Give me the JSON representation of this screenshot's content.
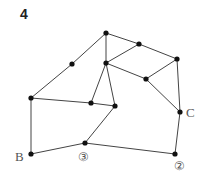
{
  "title": "4",
  "diagram": {
    "type": "graph",
    "nodes": [
      {
        "id": "n1",
        "x": 106,
        "y": 33
      },
      {
        "id": "n2",
        "x": 139,
        "y": 44
      },
      {
        "id": "n3",
        "x": 177,
        "y": 59
      },
      {
        "id": "n4",
        "x": 72,
        "y": 64
      },
      {
        "id": "n5",
        "x": 106,
        "y": 63
      },
      {
        "id": "n6",
        "x": 146,
        "y": 79
      },
      {
        "id": "n7",
        "x": 31,
        "y": 98
      },
      {
        "id": "n8",
        "x": 91,
        "y": 103
      },
      {
        "id": "n9",
        "x": 115,
        "y": 106
      },
      {
        "id": "C",
        "x": 180,
        "y": 112
      },
      {
        "id": "n11",
        "x": 85,
        "y": 143
      },
      {
        "id": "B",
        "x": 31,
        "y": 154
      },
      {
        "id": "n13",
        "x": 175,
        "y": 154
      }
    ],
    "edges": [
      [
        "n1",
        "n2"
      ],
      [
        "n2",
        "n3"
      ],
      [
        "n1",
        "n5"
      ],
      [
        "n1",
        "n4"
      ],
      [
        "n4",
        "n7"
      ],
      [
        "n5",
        "n2"
      ],
      [
        "n5",
        "n6"
      ],
      [
        "n6",
        "n3"
      ],
      [
        "n6",
        "C"
      ],
      [
        "n3",
        "C"
      ],
      [
        "n5",
        "n8"
      ],
      [
        "n5",
        "n9"
      ],
      [
        "n7",
        "n8"
      ],
      [
        "n8",
        "n9"
      ],
      [
        "n9",
        "n11"
      ],
      [
        "n7",
        "B"
      ],
      [
        "B",
        "n11"
      ],
      [
        "n11",
        "n13"
      ],
      [
        "n13",
        "C"
      ]
    ],
    "labels": {
      "B": "B",
      "C": "C",
      "circ3": "③",
      "circ2": "②"
    }
  }
}
